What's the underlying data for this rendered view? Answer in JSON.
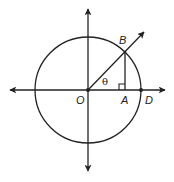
{
  "diagram": {
    "type": "unit-circle-trig",
    "colors": {
      "stroke": "#222222",
      "background": "#ffffff"
    },
    "circle": {
      "center_label": "O",
      "cx": 88,
      "cy": 90,
      "r": 53
    },
    "axes": {
      "horizontal": {
        "x1": 9,
        "x2": 166,
        "y": 90
      },
      "vertical": {
        "x": 88,
        "y1": 8,
        "y2": 172
      }
    },
    "points": {
      "O": {
        "label": "O",
        "x": 88,
        "y": 90
      },
      "A": {
        "label": "A",
        "x": 125,
        "y": 90
      },
      "B": {
        "label": "B",
        "x": 125,
        "y": 52
      },
      "D": {
        "label": "D",
        "x": 141,
        "y": 90
      }
    },
    "ray": {
      "from": "O",
      "through": "B",
      "tip_x": 145,
      "tip_y": 31
    },
    "angle_label": "θ",
    "right_angle_at": "A"
  }
}
